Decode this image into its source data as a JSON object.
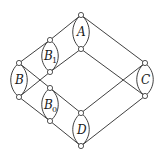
{
  "diagram": {
    "type": "graph",
    "components": [
      {
        "id": "A",
        "label": "A",
        "subscript": "",
        "top": [
          81,
          15
        ],
        "bottom": [
          81,
          49
        ]
      },
      {
        "id": "B1",
        "label": "B",
        "subscript": "1",
        "top": [
          50,
          40
        ],
        "bottom": [
          50,
          72
        ]
      },
      {
        "id": "B",
        "label": "B",
        "subscript": "",
        "top": [
          19,
          63
        ],
        "bottom": [
          19,
          97
        ]
      },
      {
        "id": "B0",
        "label": "B",
        "subscript": "0",
        "top": [
          50,
          88
        ],
        "bottom": [
          50,
          121
        ]
      },
      {
        "id": "C",
        "label": "C",
        "subscript": "",
        "top": [
          145,
          63
        ],
        "bottom": [
          145,
          96
        ]
      },
      {
        "id": "D",
        "label": "D",
        "subscript": "",
        "top": [
          81,
          113
        ],
        "bottom": [
          81,
          146
        ]
      }
    ],
    "edges": [
      [
        "A.top",
        "B1.top"
      ],
      [
        "B1.top",
        "B.top"
      ],
      [
        "A.top",
        "C.top"
      ],
      [
        "A.bottom",
        "B1.bottom"
      ],
      [
        "B1.bottom",
        "B.bottom"
      ],
      [
        "A.bottom",
        "C.bottom"
      ],
      [
        "B.top",
        "B0.top"
      ],
      [
        "B0.top",
        "D.top"
      ],
      [
        "B.bottom",
        "B0.bottom"
      ],
      [
        "B0.bottom",
        "D.bottom"
      ],
      [
        "D.top",
        "C.top"
      ],
      [
        "D.bottom",
        "C.bottom"
      ]
    ],
    "colors": {
      "stroke": "#2a2a2a",
      "node_fill": "#ffffff",
      "background": "#ffffff"
    }
  }
}
